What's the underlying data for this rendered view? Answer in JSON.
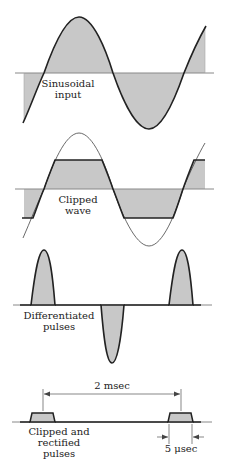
{
  "colors": {
    "stroke": "#222222",
    "fill": "#c8c8c8",
    "axis": "#888888",
    "thin": "#444444"
  },
  "panels": [
    {
      "id": "sinusoidal",
      "label_lines": [
        "Sinusoidal",
        "input"
      ]
    },
    {
      "id": "clipped",
      "label_lines": [
        "Clipped",
        "wave"
      ]
    },
    {
      "id": "differentiated",
      "label_lines": [
        "Differentiated",
        "pulses"
      ]
    },
    {
      "id": "rectified",
      "label_lines": [
        "Clipped and",
        "rectified",
        "pulses"
      ]
    }
  ],
  "annotations": {
    "period": "2 msec",
    "pulse_width": "5 μsec"
  }
}
